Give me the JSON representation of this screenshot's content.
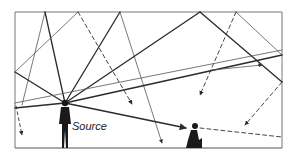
{
  "diagram": {
    "type": "sound-reflection-room",
    "labels": {
      "source": "Source"
    },
    "room": {
      "left": 15,
      "top": 12,
      "right": 282,
      "floor": 148
    },
    "source_point": [
      65,
      103
    ],
    "listener_point": [
      190,
      130
    ],
    "colors": {
      "line": "#2a2a2a",
      "thin": "#555555",
      "wall": "#666666",
      "figure": "#1a1a1a"
    }
  }
}
